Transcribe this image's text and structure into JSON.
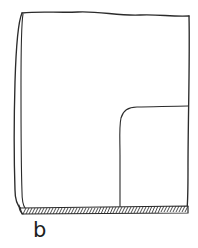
{
  "figure": {
    "caption": "b",
    "kind": "hand-drawn technical line illustration",
    "background_color": "#ffffff",
    "ink_color": "#2b2b2b",
    "label_color": "#1d1d1d",
    "parts": {
      "outer_body_label": "outer body outline",
      "left_edge_label": "double-line left edge band",
      "top_edge_label": "top edge",
      "right_edge_label": "right edge",
      "inner_feature_label": "rounded-corner inner recess",
      "section_band_label": "hatched section band at base"
    },
    "geometry": {
      "width": 198,
      "height": 248,
      "top_edge_y": 14,
      "bottom_band_y": 207,
      "left_edge_x": 22,
      "right_edge_x": 188,
      "inner_corner_radius": 17,
      "inner_vertical_x": 120,
      "inner_horizontal_y": 107,
      "hatch_count": 58
    }
  }
}
